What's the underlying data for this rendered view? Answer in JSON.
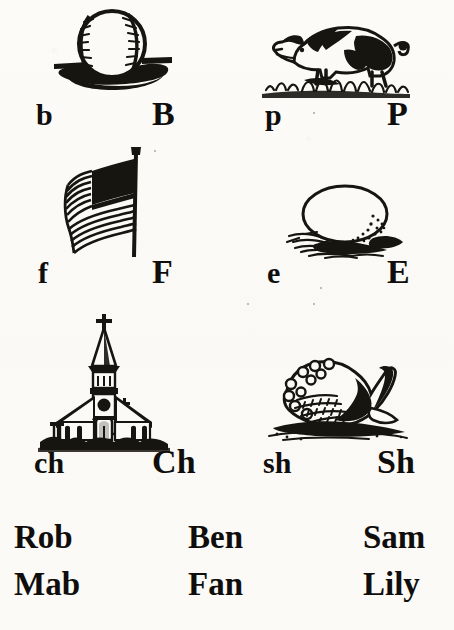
{
  "page": {
    "kind": "primer-picture-letter-page",
    "background_color": "#fbfaf7",
    "ink_color": "#100e0c",
    "width": 454,
    "height": 630
  },
  "picture_letter_rows": [
    {
      "row_index": 0,
      "cells": [
        {
          "illustration": "baseball-illustration",
          "subject": "baseball resting on ground with shadow",
          "lowercase": "b",
          "uppercase": "B"
        },
        {
          "illustration": "pig-illustration",
          "subject": "spotted pig rooting in grass",
          "lowercase": "p",
          "uppercase": "P"
        }
      ]
    },
    {
      "row_index": 1,
      "cells": [
        {
          "illustration": "flag-illustration",
          "subject": "american flag waving on a pole",
          "lowercase": "f",
          "uppercase": "F"
        },
        {
          "illustration": "egg-illustration",
          "subject": "egg lying in straw nest",
          "lowercase": "e",
          "uppercase": "E"
        }
      ]
    },
    {
      "row_index": 2,
      "cells": [
        {
          "illustration": "church-illustration",
          "subject": "church with steeple and cross",
          "lowercase": "ch",
          "uppercase": "Ch"
        },
        {
          "illustration": "shell-illustration",
          "subject": "conch shell on sand",
          "lowercase": "sh",
          "uppercase": "Sh"
        }
      ]
    }
  ],
  "word_rows": [
    {
      "row_index": 0,
      "words": [
        "Rob",
        "Ben",
        "Sam"
      ]
    },
    {
      "row_index": 1,
      "words": [
        "Mab",
        "Fan",
        "Lily"
      ]
    }
  ]
}
